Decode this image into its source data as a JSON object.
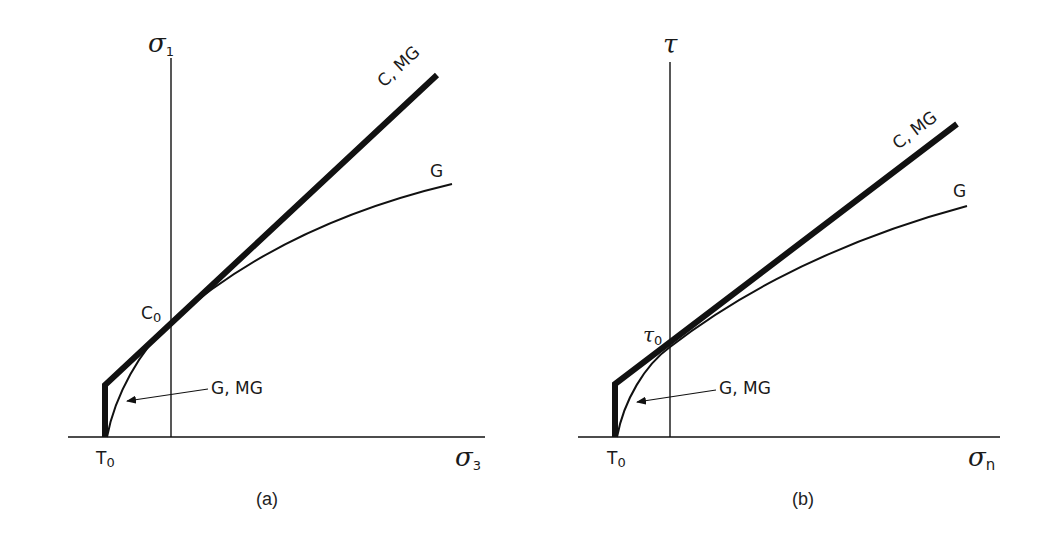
{
  "figure": {
    "colors": {
      "ink": "#111111",
      "background": "#ffffff"
    },
    "panels": [
      {
        "id": "a",
        "caption": "(a)",
        "y_axis_label": "σ",
        "y_axis_sub": "1",
        "x_axis_label": "σ",
        "x_axis_sub": "3",
        "intercept_label": "C",
        "intercept_sub": "0",
        "origin_label": "T",
        "origin_sub": "0",
        "curve_thick_label": "C, MG",
        "curve_thin_label": "G",
        "arrow_label": "G, MG"
      },
      {
        "id": "b",
        "caption": "(b)",
        "y_axis_label": "τ",
        "y_axis_sub": "",
        "x_axis_label": "σ",
        "x_axis_sub": "n",
        "intercept_label": "τ",
        "intercept_sub": "0",
        "origin_label": "T",
        "origin_sub": "0",
        "curve_thick_label": "C, MG",
        "curve_thin_label": "G",
        "arrow_label": "G, MG"
      }
    ]
  }
}
